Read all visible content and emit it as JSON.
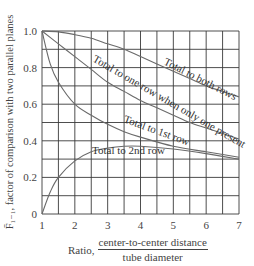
{
  "chart_data": {
    "type": "line",
    "title": "",
    "xlabel": "Ratio, center-to-center distance / tube diameter",
    "ylabel": "F̄1−1, factor of comparison with two parallel planes",
    "xlim": [
      1,
      7
    ],
    "ylim": [
      0,
      1.0
    ],
    "grid": true,
    "grid_x_step": 0.5,
    "grid_y_step": 0.1,
    "x_ticks": [
      "1",
      "2",
      "3",
      "4",
      "5",
      "6",
      "7"
    ],
    "y_ticks": [
      "0",
      "0.2",
      "0.4",
      "0.6",
      "0.8",
      "1.0"
    ],
    "series": [
      {
        "name": "Total to both rows",
        "x": [
          1,
          1.5,
          2,
          2.5,
          3,
          3.5,
          4,
          4.5,
          5,
          5.5,
          6,
          6.5,
          7
        ],
        "values": [
          1.0,
          0.995,
          0.98,
          0.96,
          0.93,
          0.9,
          0.86,
          0.82,
          0.78,
          0.74,
          0.7,
          0.67,
          0.64
        ]
      },
      {
        "name": "Total to one row when only one present",
        "x": [
          1,
          1.5,
          2,
          2.5,
          3,
          3.5,
          4,
          4.5,
          5,
          5.5,
          6,
          6.5,
          7
        ],
        "values": [
          1.0,
          0.93,
          0.86,
          0.79,
          0.72,
          0.67,
          0.62,
          0.58,
          0.54,
          0.5,
          0.47,
          0.44,
          0.41
        ]
      },
      {
        "name": "Total to 1st row",
        "x": [
          1,
          1.25,
          1.5,
          2,
          2.5,
          3,
          3.5,
          4,
          5,
          6,
          7
        ],
        "values": [
          1.0,
          0.82,
          0.72,
          0.6,
          0.54,
          0.49,
          0.45,
          0.42,
          0.37,
          0.34,
          0.31
        ]
      },
      {
        "name": "Total to 2nd row",
        "x": [
          1,
          1.25,
          1.5,
          2,
          2.5,
          3,
          3.5,
          4,
          5,
          6,
          7
        ],
        "values": [
          0.0,
          0.12,
          0.2,
          0.29,
          0.34,
          0.36,
          0.37,
          0.37,
          0.355,
          0.33,
          0.3
        ]
      }
    ]
  },
  "labels": {
    "y_axis": "F̄₁₋₁, factor of comparison with two parallel planes",
    "x_prefix": "Ratio,",
    "x_numerator": "center-to-center distance",
    "x_denominator": "tube diameter",
    "curve_both_rows": "Total to both rows",
    "curve_one_row": "Total to one row when only one present",
    "curve_first_row": "Total to 1st row",
    "curve_second_row": "Total to 2nd row"
  },
  "colors": {
    "grid": "#3a3a3a",
    "curve": "#6a6a6a",
    "text": "#444444"
  }
}
